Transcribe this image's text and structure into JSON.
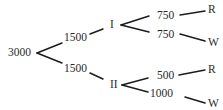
{
  "tree": {
    "root": {
      "label": "3000"
    },
    "level1": [
      {
        "amount": "1500",
        "node": "I"
      },
      {
        "amount": "1500",
        "node": "II"
      }
    ],
    "level2": {
      "I": [
        {
          "amount": "750",
          "outcome": "R"
        },
        {
          "amount": "750",
          "outcome": "W"
        }
      ],
      "II": [
        {
          "amount": "500",
          "outcome": "R"
        },
        {
          "amount": "1000",
          "outcome": "W"
        }
      ]
    }
  }
}
